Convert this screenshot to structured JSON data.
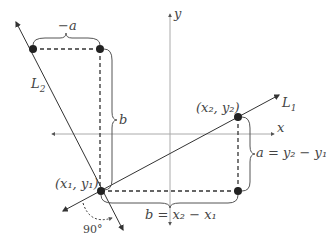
{
  "diagram": {
    "lines": [
      {
        "name": "L1",
        "label": "L",
        "sub": "1"
      },
      {
        "name": "L2",
        "label": "L",
        "sub": "2"
      }
    ],
    "axes": {
      "x_label": "x",
      "y_label": "y"
    },
    "points": {
      "p1": {
        "label": "(x₁, y₁)"
      },
      "p2": {
        "label": "(x₂, y₂)"
      }
    },
    "braces": {
      "top": "−a",
      "left": "b",
      "right": "a = y₂ − y₁",
      "bottom": "b = x₂ − x₁"
    },
    "angle_label": "90°",
    "colors": {
      "line": "#333333",
      "axis": "#999999",
      "dot": "#222222",
      "text": "#444444"
    }
  }
}
